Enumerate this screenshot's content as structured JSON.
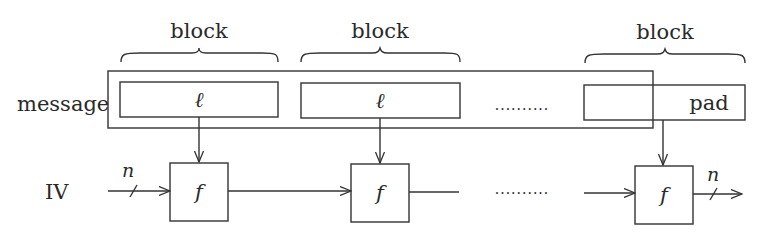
{
  "diagram": {
    "labels": {
      "message": "message",
      "iv": "IV",
      "input_width": "n",
      "output_width": "n"
    },
    "blocks": [
      {
        "brace_label": "block",
        "content": "ℓ"
      },
      {
        "brace_label": "block",
        "content": "ℓ"
      },
      {
        "brace_label": "block",
        "content": "pad"
      }
    ],
    "ellipsis": "..........",
    "compression_function": "f",
    "compression_boxes": [
      {
        "label": "f"
      },
      {
        "label": "f"
      },
      {
        "label": "f"
      }
    ],
    "colors": {
      "stroke": "#333333",
      "text": "#2a2a2a",
      "background": "#ffffff"
    }
  }
}
